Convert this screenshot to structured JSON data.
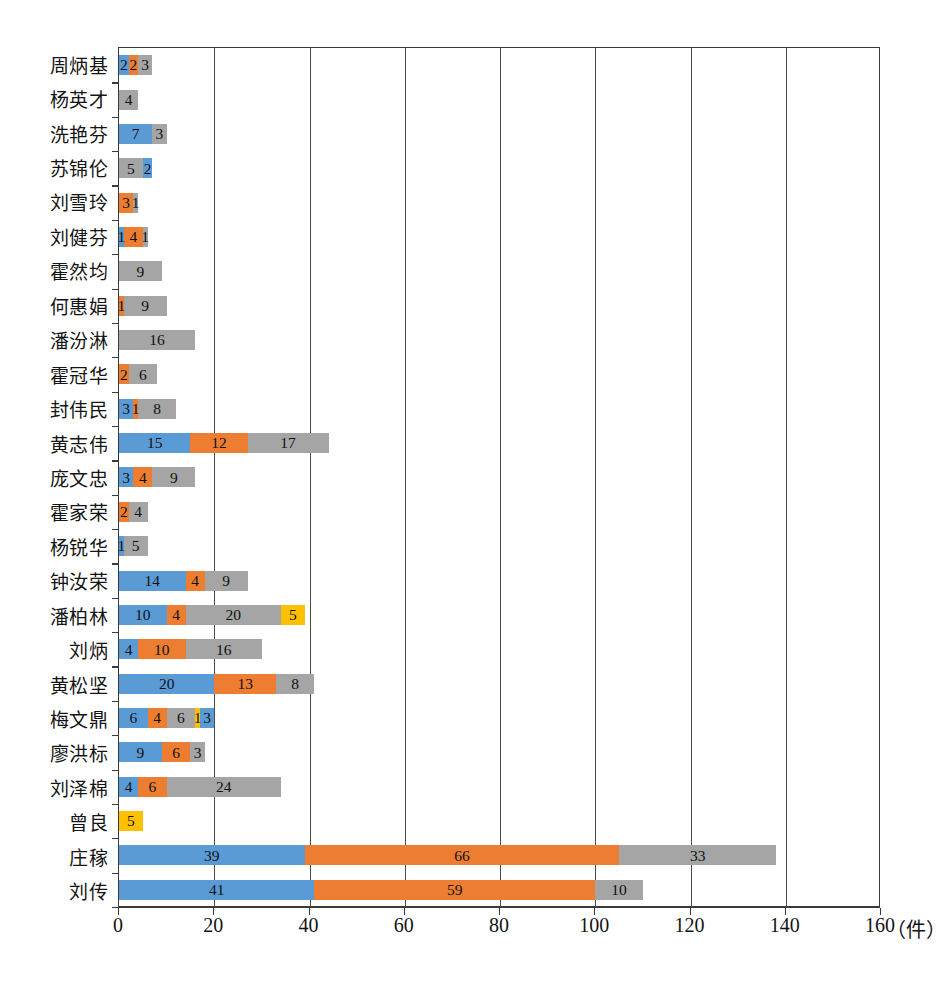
{
  "chart_data": {
    "type": "bar",
    "orientation": "horizontal",
    "stacked": true,
    "title": "",
    "subtitle": "",
    "xlabel": "",
    "ylabel": "",
    "unit_label": "（件）",
    "xlim": [
      0,
      160
    ],
    "xticks": [
      0,
      20,
      40,
      60,
      80,
      100,
      120,
      140,
      160
    ],
    "xtick_labels": [
      "0",
      "20",
      "40",
      "60",
      "80",
      "100",
      "120",
      "140",
      "160"
    ],
    "grid": "vertical",
    "legend": "none",
    "series_colors": {
      "blue": "#5B9BD5",
      "orange": "#ED7D31",
      "gray": "#A5A5A5",
      "yellow": "#FFC000"
    },
    "categories": [
      "周炳基",
      "杨英才",
      "洗艳芬",
      "苏锦伦",
      "刘雪玲",
      "刘健芬",
      "霍然均",
      "何惠娟",
      "潘汾淋",
      "霍冠华",
      "封伟民",
      "黄志伟",
      "庞文忠",
      "霍家荣",
      "杨锐华",
      "钟汝荣",
      "潘柏林",
      "刘炳",
      "黄松坚",
      "梅文鼎",
      "廖洪标",
      "刘泽棉",
      "曾良",
      "庄稼",
      "刘传"
    ],
    "rows": [
      {
        "label": "周炳基",
        "total": 7,
        "segments": [
          {
            "color": "blue",
            "value": 2
          },
          {
            "color": "orange",
            "value": 2
          },
          {
            "color": "gray",
            "value": 3
          }
        ]
      },
      {
        "label": "杨英才",
        "total": 4,
        "segments": [
          {
            "color": "gray",
            "value": 4
          }
        ]
      },
      {
        "label": "洗艳芬",
        "total": 10,
        "segments": [
          {
            "color": "blue",
            "value": 7
          },
          {
            "color": "gray",
            "value": 3
          }
        ]
      },
      {
        "label": "苏锦伦",
        "total": 7,
        "segments": [
          {
            "color": "gray",
            "value": 5
          },
          {
            "color": "blue",
            "value": 2
          }
        ]
      },
      {
        "label": "刘雪玲",
        "total": 4,
        "segments": [
          {
            "color": "orange",
            "value": 3
          },
          {
            "color": "gray",
            "value": 1
          }
        ]
      },
      {
        "label": "刘健芬",
        "total": 6,
        "segments": [
          {
            "color": "blue",
            "value": 1
          },
          {
            "color": "orange",
            "value": 4
          },
          {
            "color": "gray",
            "value": 1
          }
        ]
      },
      {
        "label": "霍然均",
        "total": 9,
        "segments": [
          {
            "color": "gray",
            "value": 9
          }
        ]
      },
      {
        "label": "何惠娟",
        "total": 10,
        "segments": [
          {
            "color": "orange",
            "value": 1
          },
          {
            "color": "gray",
            "value": 9
          }
        ]
      },
      {
        "label": "潘汾淋",
        "total": 16,
        "segments": [
          {
            "color": "gray",
            "value": 16
          }
        ]
      },
      {
        "label": "霍冠华",
        "total": 8,
        "segments": [
          {
            "color": "orange",
            "value": 2
          },
          {
            "color": "gray",
            "value": 6
          }
        ]
      },
      {
        "label": "封伟民",
        "total": 12,
        "segments": [
          {
            "color": "blue",
            "value": 3
          },
          {
            "color": "orange",
            "value": 1
          },
          {
            "color": "gray",
            "value": 8
          }
        ]
      },
      {
        "label": "黄志伟",
        "total": 44,
        "segments": [
          {
            "color": "blue",
            "value": 15
          },
          {
            "color": "orange",
            "value": 12
          },
          {
            "color": "gray",
            "value": 17
          }
        ]
      },
      {
        "label": "庞文忠",
        "total": 16,
        "segments": [
          {
            "color": "blue",
            "value": 3
          },
          {
            "color": "orange",
            "value": 4
          },
          {
            "color": "gray",
            "value": 9
          }
        ]
      },
      {
        "label": "霍家荣",
        "total": 6,
        "segments": [
          {
            "color": "orange",
            "value": 2
          },
          {
            "color": "gray",
            "value": 4
          }
        ]
      },
      {
        "label": "杨锐华",
        "total": 6,
        "segments": [
          {
            "color": "blue",
            "value": 1
          },
          {
            "color": "gray",
            "value": 5
          }
        ]
      },
      {
        "label": "钟汝荣",
        "total": 27,
        "segments": [
          {
            "color": "blue",
            "value": 14
          },
          {
            "color": "orange",
            "value": 4
          },
          {
            "color": "gray",
            "value": 9
          }
        ]
      },
      {
        "label": "潘柏林",
        "total": 39,
        "segments": [
          {
            "color": "blue",
            "value": 10
          },
          {
            "color": "orange",
            "value": 4
          },
          {
            "color": "gray",
            "value": 20
          },
          {
            "color": "yellow",
            "value": 5
          }
        ]
      },
      {
        "label": "刘炳",
        "total": 30,
        "segments": [
          {
            "color": "blue",
            "value": 4
          },
          {
            "color": "orange",
            "value": 10
          },
          {
            "color": "gray",
            "value": 16
          }
        ]
      },
      {
        "label": "黄松坚",
        "total": 41,
        "segments": [
          {
            "color": "blue",
            "value": 20
          },
          {
            "color": "orange",
            "value": 13
          },
          {
            "color": "gray",
            "value": 8
          }
        ]
      },
      {
        "label": "梅文鼎",
        "total": 20,
        "segments": [
          {
            "color": "blue",
            "value": 6
          },
          {
            "color": "orange",
            "value": 4
          },
          {
            "color": "gray",
            "value": 6
          },
          {
            "color": "yellow",
            "value": 1
          },
          {
            "color": "blue",
            "value": 3
          }
        ]
      },
      {
        "label": "廖洪标",
        "total": 18,
        "segments": [
          {
            "color": "blue",
            "value": 9
          },
          {
            "color": "orange",
            "value": 6
          },
          {
            "color": "gray",
            "value": 3
          }
        ]
      },
      {
        "label": "刘泽棉",
        "total": 34,
        "segments": [
          {
            "color": "blue",
            "value": 4
          },
          {
            "color": "orange",
            "value": 6
          },
          {
            "color": "gray",
            "value": 24
          }
        ]
      },
      {
        "label": "曾良",
        "total": 5,
        "segments": [
          {
            "color": "yellow",
            "value": 5
          }
        ]
      },
      {
        "label": "庄稼",
        "total": 138,
        "segments": [
          {
            "color": "blue",
            "value": 39
          },
          {
            "color": "orange",
            "value": 66
          },
          {
            "color": "gray",
            "value": 33
          }
        ]
      },
      {
        "label": "刘传",
        "total": 110,
        "segments": [
          {
            "color": "blue",
            "value": 41
          },
          {
            "color": "orange",
            "value": 59
          },
          {
            "color": "gray",
            "value": 10
          }
        ]
      }
    ]
  }
}
